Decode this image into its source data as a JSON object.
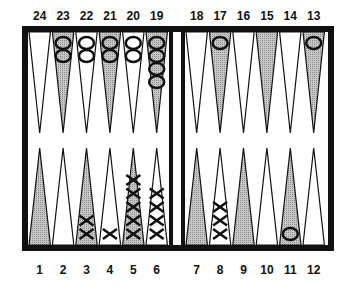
{
  "colors": {
    "frame": "#111111",
    "light_point": "#ffffff",
    "dark_point": "#b5b5b5",
    "background": "#ffffff",
    "checker_stroke": "#111111"
  },
  "board": {
    "top_labels": [
      "24",
      "23",
      "22",
      "21",
      "20",
      "19",
      "18",
      "17",
      "16",
      "15",
      "14",
      "13"
    ],
    "bottom_labels": [
      "1",
      "2",
      "3",
      "4",
      "5",
      "6",
      "7",
      "8",
      "9",
      "10",
      "11",
      "12"
    ],
    "top_points": [
      {
        "point": 24,
        "shade": "light",
        "checker": "O",
        "count": 0
      },
      {
        "point": 23,
        "shade": "dark",
        "checker": "O",
        "count": 2
      },
      {
        "point": 22,
        "shade": "light",
        "checker": "O",
        "count": 2
      },
      {
        "point": 21,
        "shade": "dark",
        "checker": "O",
        "count": 2
      },
      {
        "point": 20,
        "shade": "light",
        "checker": "O",
        "count": 2
      },
      {
        "point": 19,
        "shade": "dark",
        "checker": "O",
        "count": 4
      },
      {
        "point": 18,
        "shade": "light",
        "checker": "O",
        "count": 0
      },
      {
        "point": 17,
        "shade": "dark",
        "checker": "O",
        "count": 1
      },
      {
        "point": 16,
        "shade": "light",
        "checker": "O",
        "count": 0
      },
      {
        "point": 15,
        "shade": "dark",
        "checker": "O",
        "count": 0
      },
      {
        "point": 14,
        "shade": "light",
        "checker": "O",
        "count": 0
      },
      {
        "point": 13,
        "shade": "dark",
        "checker": "O",
        "count": 1
      }
    ],
    "bottom_points": [
      {
        "point": 1,
        "shade": "dark",
        "checker": "X",
        "count": 0
      },
      {
        "point": 2,
        "shade": "light",
        "checker": "X",
        "count": 0
      },
      {
        "point": 3,
        "shade": "dark",
        "checker": "X",
        "count": 2
      },
      {
        "point": 4,
        "shade": "light",
        "checker": "X",
        "count": 1
      },
      {
        "point": 5,
        "shade": "dark",
        "checker": "X",
        "count": 5
      },
      {
        "point": 6,
        "shade": "light",
        "checker": "X",
        "count": 4
      },
      {
        "point": 7,
        "shade": "dark",
        "checker": "X",
        "count": 0
      },
      {
        "point": 8,
        "shade": "light",
        "checker": "X",
        "count": 3
      },
      {
        "point": 9,
        "shade": "dark",
        "checker": "X",
        "count": 0
      },
      {
        "point": 10,
        "shade": "light",
        "checker": "X",
        "count": 0
      },
      {
        "point": 11,
        "shade": "dark",
        "checker": "O",
        "count": 1
      },
      {
        "point": 12,
        "shade": "light",
        "checker": "X",
        "count": 0
      }
    ]
  }
}
